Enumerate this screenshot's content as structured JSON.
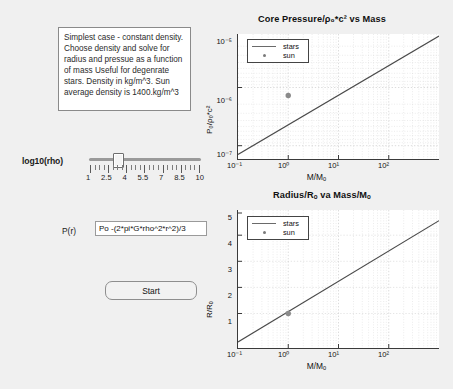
{
  "window": {
    "background_color": "#f0f0f0"
  },
  "controls": {
    "info_text": "Simplest case - constant density. Choose density and solve for radius and pressue as a function of mass  Useful for degenrate stars. Density in kg/m^3. Sun average density is 1400.kg/m^3",
    "slider": {
      "label": "log10(rho)",
      "tick_labels": [
        "1",
        "2.5",
        "4",
        "5.5",
        "7",
        "8.5",
        "10"
      ],
      "min": 1,
      "max": 10,
      "value": 3.1
    },
    "pressure_field": {
      "label": "P(r)",
      "value": "Po -(2*pi*G*rho^2*r^2)/3",
      "placeholder": "P(r) expression"
    },
    "start_button": {
      "label": "Start"
    }
  },
  "chart_data": [
    {
      "type": "line",
      "id": "pressure-chart",
      "title": "Core Pressure/ρ₀*c² vs Mass",
      "xlabel": "M/Mₒ",
      "ylabel": "P₀/ρ₀*c²",
      "xscale": "log",
      "yscale": "log",
      "xlim": [
        0.1,
        100
      ],
      "ylim": [
        1e-07,
        3e-05
      ],
      "xticks": [
        "10⁻¹",
        "10⁰",
        "10¹",
        "10²"
      ],
      "xtick_values": [
        0.1,
        1,
        10,
        100
      ],
      "yticks": [
        "10⁻⁵",
        "10⁻⁶",
        "10⁻⁷"
      ],
      "ytick_values": [
        1e-05,
        1e-06,
        1e-07
      ],
      "grid": true,
      "legend_position": "top-left",
      "series": [
        {
          "name": "stars",
          "style": "line",
          "x": [
            0.1,
            100
          ],
          "y": [
            1.55e-07,
            3.3e-05
          ]
        },
        {
          "name": "sun",
          "style": "marker",
          "x": [
            1.0
          ],
          "y": [
            1.6e-06
          ]
        }
      ]
    },
    {
      "type": "line",
      "id": "radius-chart",
      "title": "Radius/Rₒ va Mass/Mₒ",
      "xlabel": "M/Mₒ",
      "ylabel": "R/Rₒ",
      "xscale": "log",
      "yscale": "linear",
      "xlim": [
        0.1,
        100
      ],
      "ylim": [
        0,
        5.3
      ],
      "xticks": [
        "10⁻¹",
        "10⁰",
        "10¹",
        "10²"
      ],
      "xtick_values": [
        0.1,
        1,
        10,
        100
      ],
      "yticks": [
        "1",
        "2",
        "3",
        "4",
        "5"
      ],
      "ytick_values": [
        1,
        2,
        3,
        4,
        5
      ],
      "grid": true,
      "legend_position": "top-left",
      "series": [
        {
          "name": "stars",
          "style": "line",
          "x": [
            0.1,
            100
          ],
          "y": [
            0.22,
            4.85
          ]
        },
        {
          "name": "sun",
          "style": "marker",
          "x": [
            1.0
          ],
          "y": [
            1.0
          ]
        }
      ]
    }
  ],
  "legend": {
    "stars_label": "stars",
    "sun_label": "sun"
  }
}
